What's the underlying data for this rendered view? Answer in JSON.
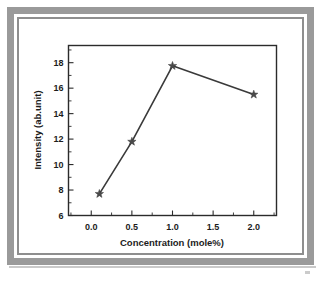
{
  "figure": {
    "background_color": "#ffffff",
    "frame_color": "#9a9a9a",
    "frame_inner_color": "#8e8e8e"
  },
  "chart_data": {
    "type": "line",
    "title": "",
    "subtitle": "",
    "xlabel": "Concentration (mole%)",
    "ylabel": "Intensity (ab.unit)",
    "x": [
      0.1,
      0.5,
      1.0,
      2.0
    ],
    "values": [
      7.7,
      11.8,
      17.75,
      15.5
    ],
    "series": [
      {
        "name": "Intensity",
        "x": [
          0.1,
          0.5,
          1.0,
          2.0
        ],
        "values": [
          7.7,
          11.8,
          17.75,
          15.5
        ],
        "marker": "star",
        "marker_color": "#4a4a4a",
        "line_color": "#3a3a3a"
      }
    ],
    "xlim": [
      -0.28,
      2.28
    ],
    "ylim": [
      6.0,
      19.35
    ],
    "xticks": [
      0.0,
      0.5,
      1.0,
      1.5,
      2.0
    ],
    "xtick_labels": [
      "0.0",
      "0.5",
      "1.0",
      "1.5",
      "2.0"
    ],
    "yticks": [
      6,
      8,
      10,
      12,
      14,
      16,
      18
    ],
    "ytick_labels": [
      "6",
      "8",
      "10",
      "12",
      "14",
      "16",
      "18"
    ],
    "x_minor_ticks": [
      -0.25,
      0.25,
      0.75,
      1.25,
      1.75,
      2.25
    ],
    "y_minor_ticks": [
      7,
      9,
      11,
      13,
      15,
      17,
      19
    ],
    "grid": false,
    "legend": null,
    "legend_position": "none",
    "annotations": [],
    "tick_direction": "out",
    "frame": "box"
  }
}
